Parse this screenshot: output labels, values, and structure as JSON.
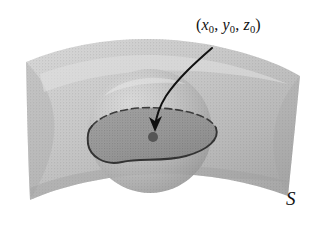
{
  "figure": {
    "caption_alt": "Smooth surface S with a spherical neighborhood around a point, enclosing a surface patch",
    "background_color": "#ffffff"
  },
  "labels": {
    "point": {
      "full_text": "(x0, y0, z0)",
      "open_paren": "(",
      "x_var": "x",
      "x_sub": "0",
      "comma1": ",",
      "y_var": "y",
      "y_sub": "0",
      "comma2": ",",
      "z_var": "z",
      "z_sub": "0",
      "close_paren": ")"
    },
    "surface": {
      "text": "S"
    }
  },
  "colors": {
    "sheet_light": "#c9c9c9",
    "sheet_mid": "#bdbdbd",
    "sheet_shadow": "#a8a8a8",
    "sphere_highlight": "#d2d2d2",
    "sphere_mid": "#b6b6b6",
    "sphere_shadow": "#8e8e8e",
    "sphere_below": "#8a8a8a",
    "patch_fill": "#9b9b9b",
    "patch_outline": "#3a3a3a",
    "arrow_stroke": "#101010",
    "point_dot": "#555555",
    "text": "#111111"
  },
  "geometry": {
    "sphere": {
      "cx": 150,
      "cy": 131,
      "r": 62
    },
    "point_dot": {
      "cx": 153,
      "cy": 137,
      "r": 5
    },
    "arrow": {
      "from_x": 212,
      "from_y": 48,
      "to_x": 155,
      "to_y": 128
    },
    "patch_boundary_style": {
      "upper": "dashed",
      "lower": "solid"
    }
  }
}
